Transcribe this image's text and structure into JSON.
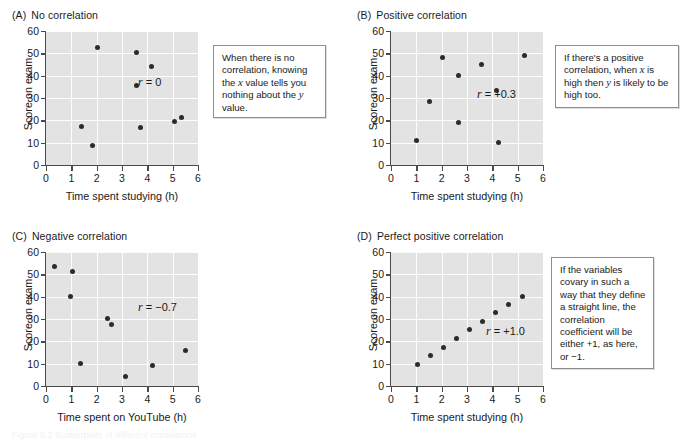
{
  "figure": {
    "caption_partial": "Figure 6.2  Scatterplots of different correlations"
  },
  "axis_common": {
    "y_title": "Score on exam",
    "y_ticks": [
      0,
      10,
      20,
      30,
      40,
      50,
      60
    ],
    "x_ticks": [
      0,
      1,
      2,
      3,
      4,
      5,
      6
    ],
    "xlim": [
      0,
      6
    ],
    "ylim": [
      0,
      60
    ],
    "grid": "white gridlines on gray panel",
    "panel_color": "#e3e3e3",
    "grid_color": "#fdfdfd",
    "dot_color": "#2b2b2b",
    "axis_color": "#4a4a4a"
  },
  "panels": [
    {
      "tag": "(A)",
      "title": "No correlation",
      "r_prefix": "r",
      "r_value": "= 0",
      "callout": "When there is no correlation, knowing the <em>x</em> value tells you nothing about the <em>y</em> value.",
      "xlabel": "Time spent studying (h)"
    },
    {
      "tag": "(B)",
      "title": "Positive correlation",
      "r_prefix": "r",
      "r_value": "= +0.3",
      "callout": "If there's a positive correlation, when <em>x</em> is high then <em>y</em> is likely to be high too.",
      "xlabel": "Time spent studying (h)"
    },
    {
      "tag": "(C)",
      "title": "Negative correlation",
      "r_prefix": "r",
      "r_value": "= −0.7",
      "callout": "If there's a negative correlation, when <em>x</em> is high then <em>y</em> is likely to be low.",
      "xlabel": "Time spent on YouTube (h)"
    },
    {
      "tag": "(D)",
      "title": "Perfect positive correlation",
      "r_prefix": "r",
      "r_value": "= +1.0",
      "callout": "If the variables covary in such a way that they define a straight line, the correlation coefficient will be either +1, as here, or −1.",
      "xlabel": "Time spent studying (h)"
    }
  ],
  "chart_data": [
    {
      "type": "scatter",
      "title": "(A) No correlation",
      "xlabel": "Time spent studying (h)",
      "ylabel": "Score on exam",
      "xlim": [
        0,
        6
      ],
      "ylim": [
        0,
        60
      ],
      "grid": true,
      "annotation": "r = 0",
      "points": [
        {
          "x": 1.4,
          "y": 17.3
        },
        {
          "x": 1.85,
          "y": 8.6
        },
        {
          "x": 2.02,
          "y": 52.5
        },
        {
          "x": 3.58,
          "y": 50.3
        },
        {
          "x": 3.58,
          "y": 35.8
        },
        {
          "x": 3.72,
          "y": 16.7
        },
        {
          "x": 4.18,
          "y": 44.2
        },
        {
          "x": 5.08,
          "y": 19.5
        },
        {
          "x": 5.35,
          "y": 21.3
        }
      ]
    },
    {
      "type": "scatter",
      "title": "(B) Positive correlation",
      "xlabel": "Time spent studying (h)",
      "ylabel": "Score on exam",
      "xlim": [
        0,
        6
      ],
      "ylim": [
        0,
        60
      ],
      "grid": true,
      "annotation": "r = +0.3",
      "points": [
        {
          "x": 1.0,
          "y": 11.0
        },
        {
          "x": 1.52,
          "y": 28.3
        },
        {
          "x": 2.05,
          "y": 48.3
        },
        {
          "x": 2.65,
          "y": 40.1
        },
        {
          "x": 2.68,
          "y": 19.0
        },
        {
          "x": 3.58,
          "y": 45.0
        },
        {
          "x": 4.18,
          "y": 33.2
        },
        {
          "x": 4.25,
          "y": 10.1
        },
        {
          "x": 5.28,
          "y": 49.2
        }
      ]
    },
    {
      "type": "scatter",
      "title": "(C) Negative correlation",
      "xlabel": "Time spent on YouTube (h)",
      "ylabel": "Score on exam",
      "xlim": [
        0,
        6
      ],
      "ylim": [
        0,
        60
      ],
      "grid": true,
      "annotation": "r = −0.7",
      "points": [
        {
          "x": 0.33,
          "y": 53.4
        },
        {
          "x": 0.98,
          "y": 40.0
        },
        {
          "x": 1.03,
          "y": 51.4
        },
        {
          "x": 1.35,
          "y": 10.2
        },
        {
          "x": 2.42,
          "y": 30.3
        },
        {
          "x": 2.6,
          "y": 27.6
        },
        {
          "x": 3.12,
          "y": 4.4
        },
        {
          "x": 4.2,
          "y": 9.2
        },
        {
          "x": 5.52,
          "y": 15.9
        }
      ]
    },
    {
      "type": "scatter",
      "title": "(D) Perfect positive correlation",
      "xlabel": "Time spent studying (h)",
      "ylabel": "Score on exam",
      "xlim": [
        0,
        6
      ],
      "ylim": [
        0,
        60
      ],
      "grid": true,
      "annotation": "r = +1.0",
      "points": [
        {
          "x": 1.03,
          "y": 9.8
        },
        {
          "x": 1.55,
          "y": 13.5
        },
        {
          "x": 2.08,
          "y": 17.2
        },
        {
          "x": 2.58,
          "y": 21.2
        },
        {
          "x": 3.08,
          "y": 25.1
        },
        {
          "x": 3.62,
          "y": 29.1
        },
        {
          "x": 4.12,
          "y": 32.8
        },
        {
          "x": 4.65,
          "y": 36.5
        },
        {
          "x": 5.18,
          "y": 40.2
        }
      ]
    }
  ]
}
